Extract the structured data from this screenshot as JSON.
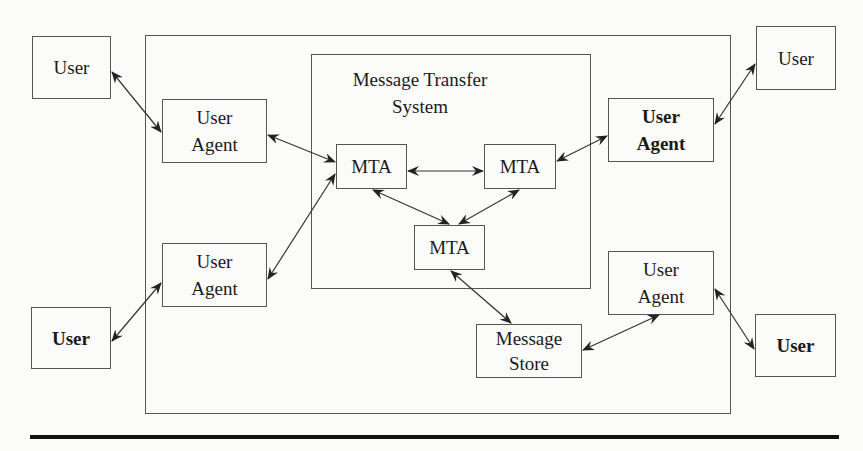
{
  "diagram": {
    "type": "message-handling-system-architecture",
    "mts_title": "Message Transfer\nSystem",
    "mts_title_line1": "Message Transfer",
    "mts_title_line2": "System",
    "nodes": {
      "user_top_left": {
        "label": "User",
        "bold": false
      },
      "user_agent_top_left": {
        "label": "User\nAgent",
        "line1": "User",
        "line2": "Agent",
        "bold": false
      },
      "user_agent_bottom_left": {
        "label": "User\nAgent",
        "line1": "User",
        "line2": "Agent",
        "bold": false
      },
      "user_bottom_left": {
        "label": "User",
        "bold": true
      },
      "mta_left": {
        "label": "MTA"
      },
      "mta_right": {
        "label": "MTA"
      },
      "mta_bottom": {
        "label": "MTA"
      },
      "user_agent_top_right": {
        "label": "User\nAgent",
        "line1": "User",
        "line2": "Agent",
        "bold": true
      },
      "user_top_right": {
        "label": "User",
        "bold": false
      },
      "user_agent_bottom_right": {
        "label": "User\nAgent",
        "line1": "User",
        "line2": "Agent",
        "bold": false
      },
      "message_store": {
        "label": "Message\nStore",
        "line1": "Message",
        "line2": "Store"
      },
      "user_bottom_right": {
        "label": "User",
        "bold": true
      }
    },
    "edges": [
      {
        "from": "user_top_left",
        "to": "user_agent_top_left",
        "direction": "bidirectional"
      },
      {
        "from": "user_bottom_left",
        "to": "user_agent_bottom_left",
        "direction": "bidirectional"
      },
      {
        "from": "user_agent_top_left",
        "to": "mta_left",
        "direction": "bidirectional"
      },
      {
        "from": "user_agent_bottom_left",
        "to": "mta_left",
        "direction": "bidirectional"
      },
      {
        "from": "mta_left",
        "to": "mta_right",
        "direction": "bidirectional"
      },
      {
        "from": "mta_left",
        "to": "mta_bottom",
        "direction": "bidirectional"
      },
      {
        "from": "mta_right",
        "to": "mta_bottom",
        "direction": "bidirectional"
      },
      {
        "from": "mta_right",
        "to": "user_agent_top_right",
        "direction": "bidirectional"
      },
      {
        "from": "user_agent_top_right",
        "to": "user_top_right",
        "direction": "bidirectional"
      },
      {
        "from": "mta_bottom",
        "to": "message_store",
        "direction": "bidirectional"
      },
      {
        "from": "message_store",
        "to": "user_agent_bottom_right",
        "direction": "bidirectional"
      },
      {
        "from": "user_agent_bottom_right",
        "to": "user_bottom_right",
        "direction": "bidirectional"
      }
    ]
  }
}
